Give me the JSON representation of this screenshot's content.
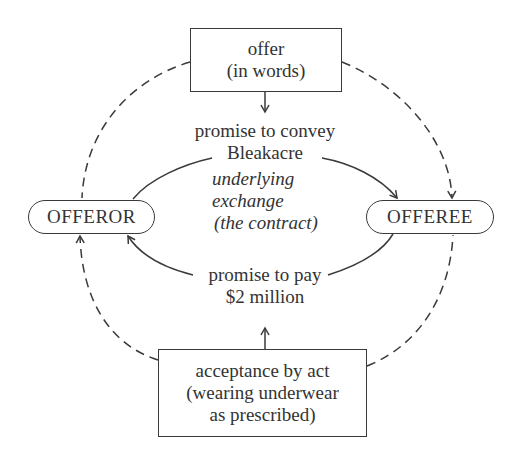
{
  "diagram": {
    "type": "contract-formation-cycle",
    "colors": {
      "stroke": "#3a3a3a",
      "text": "#333333",
      "background": "#ffffff"
    },
    "nodes": {
      "offer": {
        "shape": "rectangle",
        "lines": [
          "offer",
          "(in words)"
        ]
      },
      "offeror": {
        "shape": "rounded-pill",
        "label": "OFFEROR"
      },
      "offeree": {
        "shape": "rounded-pill",
        "label": "OFFEREE"
      },
      "acceptance": {
        "shape": "rectangle",
        "lines": [
          "acceptance by act",
          "(wearing underwear",
          "as prescribed)"
        ]
      }
    },
    "labels": {
      "promise_convey": [
        "promise to convey",
        "Bleakacre"
      ],
      "promise_pay": [
        "promise to pay",
        "$2 million"
      ],
      "center": [
        "underlying",
        "exchange",
        "(the contract)"
      ]
    },
    "edges": [
      {
        "from": "offer",
        "to": "promise_convey",
        "style": "solid",
        "arrow": "end"
      },
      {
        "from": "promise_convey",
        "to": "offeree",
        "style": "solid-curve",
        "arrow": "end"
      },
      {
        "from": "offeror",
        "to": "promise_convey",
        "style": "solid-curve",
        "arrow": "none"
      },
      {
        "from": "offeree",
        "to": "promise_pay",
        "style": "solid-curve",
        "arrow": "none"
      },
      {
        "from": "promise_pay",
        "to": "offeror",
        "style": "solid-curve",
        "arrow": "end"
      },
      {
        "from": "acceptance",
        "to": "promise_pay",
        "style": "solid",
        "arrow": "end"
      },
      {
        "from": "offer",
        "to": "offeree",
        "style": "dashed-curve",
        "arrow": "end"
      },
      {
        "from": "offer",
        "to": "offeror",
        "style": "dashed-curve",
        "arrow": "none"
      },
      {
        "from": "acceptance",
        "to": "offeror",
        "style": "dashed-curve",
        "arrow": "end"
      },
      {
        "from": "acceptance",
        "to": "offeree",
        "style": "dashed-curve",
        "arrow": "none"
      }
    ]
  }
}
